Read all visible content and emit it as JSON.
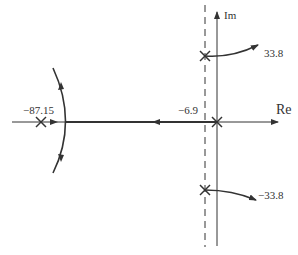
{
  "diagram": {
    "type": "root-locus",
    "axes": {
      "real_label": "Re",
      "imag_label": "Im"
    },
    "poles": [
      {
        "id": "p-origin",
        "real": 0,
        "imag": 0
      },
      {
        "id": "p-upper",
        "real": -6.9,
        "imag": 33.8
      },
      {
        "id": "p-lower",
        "real": -6.9,
        "imag": -33.8
      },
      {
        "id": "p-far",
        "real": -87.15,
        "imag": 0
      }
    ],
    "labels": {
      "far_pole": "−87.15",
      "asymptote": "−6.9",
      "upper_branch": "33.8",
      "lower_branch": "−33.8"
    },
    "asymptote_line": {
      "real": -6.9,
      "style": "dashed"
    },
    "colors": {
      "line": "#333333",
      "background": "#ffffff"
    }
  }
}
